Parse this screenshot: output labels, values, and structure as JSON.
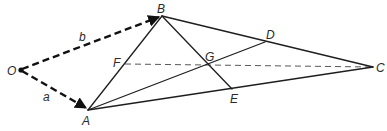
{
  "figure": {
    "type": "vector-geometry-diagram",
    "points": [
      {
        "id": "O",
        "label": "O"
      },
      {
        "id": "A",
        "label": "A"
      },
      {
        "id": "B",
        "label": "B"
      },
      {
        "id": "C",
        "label": "C"
      },
      {
        "id": "D",
        "label": "D"
      },
      {
        "id": "E",
        "label": "E"
      },
      {
        "id": "F",
        "label": "F"
      },
      {
        "id": "G",
        "label": "G"
      }
    ],
    "vectors": [
      {
        "id": "vec-a",
        "from": "O",
        "to": "A",
        "label": "a",
        "style": "dashed-arrow"
      },
      {
        "id": "vec-b",
        "from": "O",
        "to": "B",
        "label": "b",
        "style": "dashed-arrow"
      }
    ],
    "segments": [
      {
        "id": "AB",
        "from": "A",
        "to": "B",
        "style": "solid"
      },
      {
        "id": "BC",
        "from": "B",
        "to": "C",
        "style": "solid"
      },
      {
        "id": "AC",
        "from": "A",
        "to": "C",
        "style": "solid"
      },
      {
        "id": "BE",
        "from": "B",
        "to": "E",
        "style": "solid"
      },
      {
        "id": "AD",
        "from": "A",
        "to": "D",
        "style": "solid"
      },
      {
        "id": "FC",
        "from": "F",
        "to": "C",
        "style": "dashed"
      }
    ],
    "colors": {
      "ink": "#1e1e1e",
      "background": "#ffffff"
    }
  }
}
